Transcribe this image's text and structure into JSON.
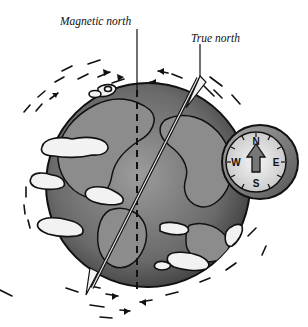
{
  "diagram": {
    "labels": {
      "magnetic_north": "Magnetic north",
      "true_north": "True north"
    },
    "compass": {
      "directions": {
        "n": "N",
        "e": "E",
        "s": "S",
        "w": "W"
      },
      "needle": "arrow pointing north"
    },
    "elements": [
      "globe",
      "clouds",
      "rotation-arrows",
      "magnetic-axis",
      "true-axis",
      "compass"
    ],
    "colors": {
      "ocean": "#6e6e6e",
      "land": "#9a9a9a",
      "cloud": "#f2f2f2",
      "outline": "#111111",
      "compass_rim": "#8a8a8a",
      "compass_face": "#e6e6e6"
    }
  }
}
